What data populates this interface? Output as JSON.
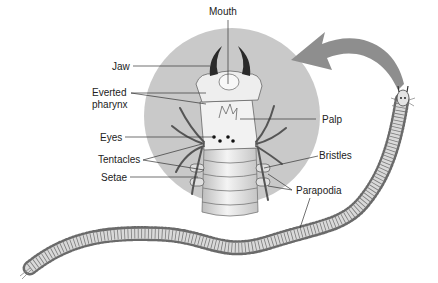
{
  "diagram": {
    "colors": {
      "circle": "#c8c8c8",
      "body": "#e6e6e6",
      "outline": "#555555",
      "arrow": "#8c8c8c",
      "jaw": "#2a2a2a",
      "leader": "#333333"
    },
    "labels": {
      "mouth": "Mouth",
      "jaw": "Jaw",
      "everted_pharynx_1": "Everted",
      "everted_pharynx_2": "pharynx",
      "eyes": "Eyes",
      "tentacles": "Tentacles",
      "setae": "Setae",
      "palp": "Palp",
      "bristles": "Bristles",
      "parapodia": "Parapodia"
    }
  }
}
